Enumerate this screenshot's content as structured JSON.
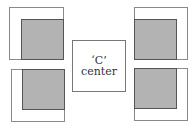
{
  "diagram": {
    "center": {
      "line1": "‘C’",
      "line2": "center"
    },
    "colors": {
      "fill": "#b3b3b3",
      "border": "#8a8a8a",
      "inner_line": "#555555",
      "background": "#ffffff"
    },
    "boxes": [
      {
        "position": "top-left",
        "filled_corner": "bottom-right",
        "strips": [
          "top",
          "left"
        ]
      },
      {
        "position": "top-right",
        "filled_corner": "bottom-left",
        "strips": [
          "top",
          "right"
        ]
      },
      {
        "position": "bottom-left",
        "filled_corner": "top-right",
        "strips": [
          "bottom",
          "left"
        ]
      },
      {
        "position": "bottom-right",
        "filled_corner": "top-left",
        "strips": [
          "bottom",
          "right"
        ]
      }
    ]
  }
}
